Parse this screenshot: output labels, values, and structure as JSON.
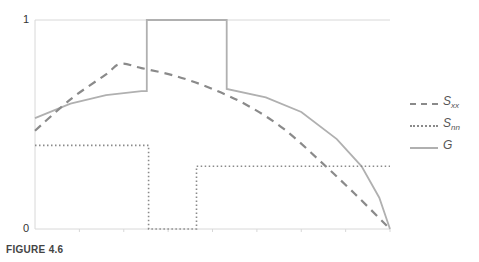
{
  "chart_data": {
    "type": "line",
    "title": "",
    "xlabel": "",
    "ylabel": "",
    "ylim": [
      0,
      1
    ],
    "xlim": [
      0,
      1
    ],
    "y_ticks": [
      "0",
      "1"
    ],
    "grid": false,
    "legend_position": "right",
    "series": [
      {
        "name": "S_xx",
        "label_main": "S",
        "label_sub": "xx",
        "style": "dashed",
        "color": "#8a8a8a",
        "x": [
          0.0,
          0.1,
          0.2,
          0.24,
          0.3,
          0.4,
          0.5,
          0.6,
          0.7,
          0.8,
          0.9,
          1.0
        ],
        "y": [
          0.47,
          0.62,
          0.74,
          0.79,
          0.77,
          0.73,
          0.67,
          0.59,
          0.48,
          0.33,
          0.17,
          0.0
        ]
      },
      {
        "name": "S_nn",
        "label_main": "S",
        "label_sub": "nn",
        "style": "dotted",
        "color": "#8a8a8a",
        "x": [
          0.0,
          0.32,
          0.32,
          0.455,
          0.455,
          1.0
        ],
        "y": [
          0.4,
          0.4,
          0.0,
          0.0,
          0.3,
          0.3
        ]
      },
      {
        "name": "G",
        "label_main": "G",
        "label_sub": "",
        "style": "solid",
        "color": "#b0b0b0",
        "x": [
          0.0,
          0.1,
          0.2,
          0.3,
          0.315,
          0.315,
          0.54,
          0.54,
          0.65,
          0.75,
          0.85,
          0.92,
          0.97,
          1.0
        ],
        "y": [
          0.53,
          0.6,
          0.64,
          0.66,
          0.66,
          1.0,
          1.0,
          0.67,
          0.63,
          0.56,
          0.43,
          0.3,
          0.15,
          0.0
        ]
      }
    ]
  },
  "legend": {
    "items": [
      {
        "main": "S",
        "sub": "xx"
      },
      {
        "main": "S",
        "sub": "nn"
      },
      {
        "main": "G",
        "sub": ""
      }
    ]
  },
  "axis": {
    "y_top_label": "1",
    "y_bottom_label": "0"
  },
  "caption": "FIGURE 4.6"
}
